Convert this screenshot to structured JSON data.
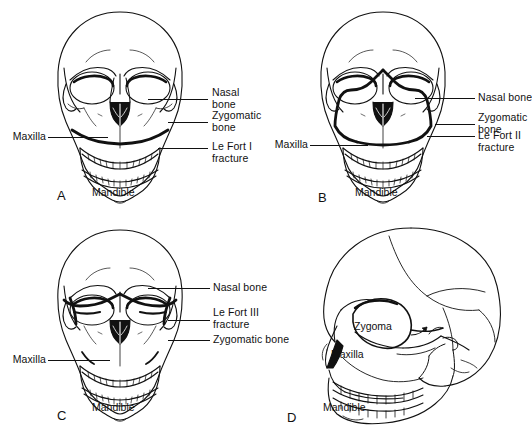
{
  "figure": {
    "type": "medical-illustration",
    "background_color": "#ffffff",
    "line_color": "#111111",
    "panel_count": 4,
    "layout": "2x2 grid"
  },
  "panels": [
    {
      "letter": "A",
      "view": "anterior",
      "fracture": "Le Fort I",
      "labels_right": [
        {
          "name": "nasal-bone",
          "lines": [
            "Nasal",
            "bone"
          ]
        },
        {
          "name": "zygomatic-bone",
          "lines": [
            "Zygomatic",
            "bone"
          ]
        },
        {
          "name": "le-fort-fracture",
          "lines": [
            "Le Fort I",
            "fracture"
          ]
        }
      ],
      "labels_left": [
        {
          "name": "maxilla",
          "lines": [
            "Maxilla"
          ]
        }
      ],
      "labels_inner": [
        {
          "name": "mandible",
          "lines": [
            "Mandible"
          ]
        }
      ]
    },
    {
      "letter": "B",
      "view": "anterior",
      "fracture": "Le Fort II",
      "labels_right": [
        {
          "name": "nasal-bone",
          "lines": [
            "Nasal bone"
          ]
        },
        {
          "name": "zygomatic-bone",
          "lines": [
            "Zygomatic",
            "bone"
          ]
        },
        {
          "name": "le-fort-fracture",
          "lines": [
            "Le Fort II",
            "fracture"
          ]
        }
      ],
      "labels_left": [
        {
          "name": "maxilla",
          "lines": [
            "Maxilla"
          ]
        }
      ],
      "labels_inner": [
        {
          "name": "mandible",
          "lines": [
            "Mandible"
          ]
        }
      ]
    },
    {
      "letter": "C",
      "view": "anterior",
      "fracture": "Le Fort III",
      "labels_right": [
        {
          "name": "nasal-bone",
          "lines": [
            "Nasal bone"
          ]
        },
        {
          "name": "le-fort-fracture",
          "lines": [
            "Le Fort III",
            "fracture"
          ]
        },
        {
          "name": "zygomatic-bone",
          "lines": [
            "Zygomatic bone"
          ]
        }
      ],
      "labels_left": [
        {
          "name": "maxilla",
          "lines": [
            "Maxilla"
          ]
        }
      ],
      "labels_inner": [
        {
          "name": "mandible",
          "lines": [
            "Mandible"
          ]
        }
      ]
    },
    {
      "letter": "D",
      "view": "lateral",
      "fracture": "",
      "labels_right": [],
      "labels_left": [],
      "labels_inner": [
        {
          "name": "zygoma",
          "lines": [
            "Zygoma"
          ]
        },
        {
          "name": "maxilla",
          "lines": [
            "Maxilla"
          ]
        },
        {
          "name": "mandible",
          "lines": [
            "Mandible"
          ]
        }
      ]
    }
  ],
  "text": {
    "a": {
      "letter": "A",
      "nasal_1": "Nasal",
      "nasal_2": "bone",
      "zygomatic_1": "Zygomatic",
      "zygomatic_2": "bone",
      "lefort_1": "Le Fort I",
      "lefort_2": "fracture",
      "maxilla": "Maxilla",
      "mandible": "Mandible"
    },
    "b": {
      "letter": "B",
      "nasal_1": "Nasal bone",
      "zygomatic_1": "Zygomatic",
      "zygomatic_2": "bone",
      "lefort_1": "Le Fort II",
      "lefort_2": "fracture",
      "maxilla": "Maxilla",
      "mandible": "Mandible"
    },
    "c": {
      "letter": "C",
      "nasal_1": "Nasal bone",
      "lefort_1": "Le Fort III",
      "lefort_2": "fracture",
      "zygomatic_1": "Zygomatic bone",
      "maxilla": "Maxilla",
      "mandible": "Mandible"
    },
    "d": {
      "letter": "D",
      "zygoma": "Zygoma",
      "maxilla": "Maxilla",
      "mandible": "Mandible"
    }
  }
}
